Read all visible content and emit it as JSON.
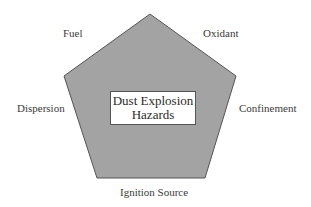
{
  "diagram": {
    "type": "pentagon",
    "fill_color": "#a3a3a3",
    "stroke_color": "#555555",
    "center": {
      "line1": "Dust Explosion",
      "line2": "Hazards"
    },
    "vertices": [
      {
        "position": "top-left",
        "label": "Fuel"
      },
      {
        "position": "top-right",
        "label": "Oxidant"
      },
      {
        "position": "left",
        "label": "Dispersion"
      },
      {
        "position": "right",
        "label": "Confinement"
      },
      {
        "position": "bottom",
        "label": "Ignition Source"
      }
    ]
  }
}
